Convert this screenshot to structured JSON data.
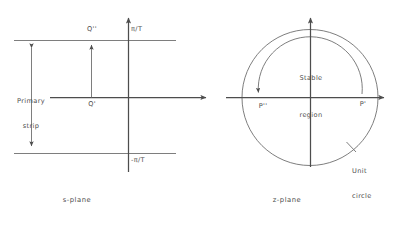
{
  "figure": {
    "ink_color": "#4d4d4d",
    "background_color": "#ffffff"
  },
  "s_plane": {
    "caption": "s-plane",
    "axis_horizontal_name": "real-axis",
    "axis_vertical_name": "imaginary-axis",
    "strip_label_line1": "Primary",
    "strip_label_line2": "strip",
    "upper_boundary_label": "π/T",
    "lower_boundary_label": "-π/T",
    "point_on_axis_label": "Q'",
    "point_on_boundary_label": "Q''"
  },
  "z_plane": {
    "caption": "z-plane",
    "axis_horizontal_name": "real-axis",
    "axis_vertical_name": "imaginary-axis",
    "stable_region_line1": "Stable",
    "stable_region_line2": "region",
    "unit_circle_label_line1": "Unit",
    "unit_circle_label_line2": "circle",
    "point_left_label": "P''",
    "point_right_label": "P'"
  }
}
